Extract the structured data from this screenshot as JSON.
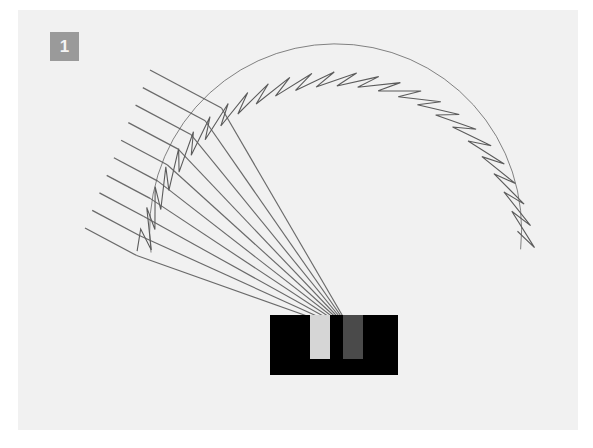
{
  "figure": {
    "panel_label": "1",
    "caption_hidden": "",
    "background_color": "#f1f1f1",
    "page_color": "#ffffff",
    "badge_color": "#9a9a9a",
    "badge_text_color": "#f4f4f4",
    "line_color": "#5b5b5b",
    "ray_color": "#6a6a6a",
    "tooth_fill": "#f7f7f7",
    "absorber_color": "#000000",
    "notch_light_color": "#d6d6d6",
    "notch_dark_color": "#4a4a4a"
  },
  "chart_data": {
    "type": "scatter",
    "title": "",
    "subtitle": "",
    "xlabel": "",
    "ylabel": "",
    "grid": false,
    "legend": "none",
    "xlim": [
      0,
      560
    ],
    "ylim": [
      0,
      420
    ],
    "arc": {
      "center_x": 318,
      "center_y": 262,
      "radius": 200,
      "start_angle_deg": 186,
      "end_angle_deg": 353,
      "tooth_count": 26,
      "tooth_depth": 14,
      "stroke_width": 1.1
    },
    "focus": {
      "x": 334,
      "y": 322,
      "label": ""
    },
    "incident_rays": {
      "count": 10,
      "direction_deg": 28,
      "start_x_range": [
        67,
        132
      ],
      "start_y_range": [
        60,
        218
      ],
      "spacing": 17.5
    },
    "absorber_block": {
      "x": 252,
      "y": 305,
      "width": 128,
      "height": 60
    },
    "notches": [
      {
        "name": "light-notch",
        "x": 292,
        "y": 305,
        "width": 20,
        "height": 44,
        "color": "#d6d6d6"
      },
      {
        "name": "focal-notch",
        "x": 325,
        "y": 305,
        "width": 20,
        "height": 44,
        "color": "#4a4a4a"
      }
    ]
  }
}
